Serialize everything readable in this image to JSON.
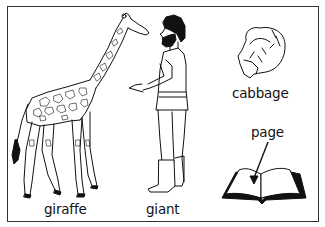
{
  "illustration": {
    "frame_color": "#333333",
    "items": [
      {
        "id": "giraffe",
        "label": "giraffe"
      },
      {
        "id": "giant",
        "label": "giant"
      },
      {
        "id": "cabbage",
        "label": "cabbage"
      },
      {
        "id": "page",
        "label": "page"
      }
    ]
  }
}
